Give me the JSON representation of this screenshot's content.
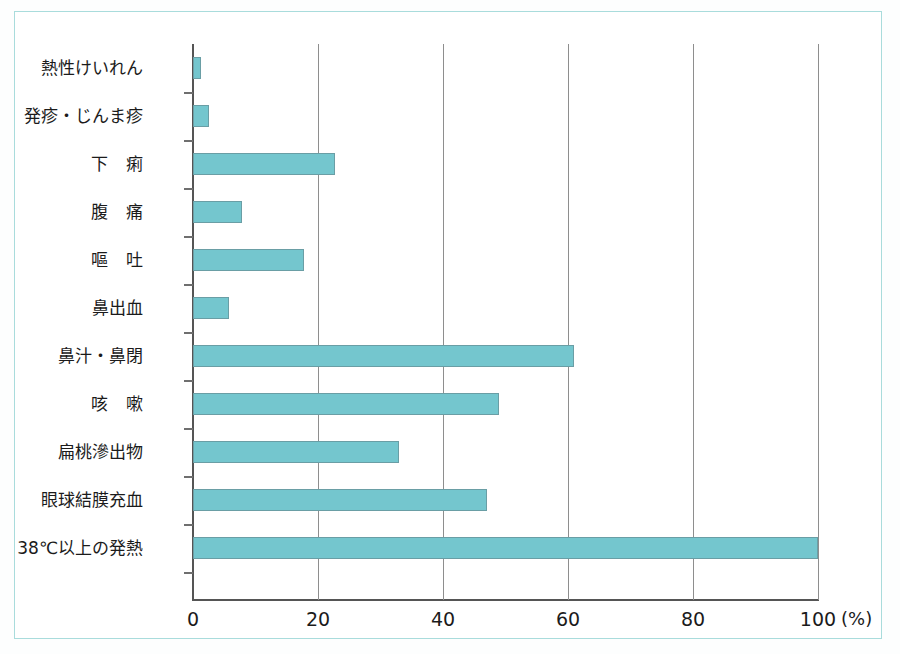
{
  "figure": {
    "accent_color": "#74c6ce",
    "frame_color": "#a9dcdc",
    "axis_color": "#555555",
    "grid_color": "#8e8e8e",
    "unit_label": "(%)"
  },
  "chart_data": {
    "type": "bar",
    "orientation": "horizontal",
    "title": "",
    "xlabel": "(%)",
    "ylabel": "",
    "xlim": [
      0,
      100
    ],
    "xticks": [
      0,
      20,
      40,
      60,
      80,
      100
    ],
    "xtick_labels": [
      "0",
      "20",
      "40",
      "60",
      "80",
      "100"
    ],
    "grid": true,
    "legend": false,
    "categories": [
      "熱性けいれん",
      "発疹・じんま疹",
      "下痢",
      "腹痛",
      "嘔吐",
      "鼻出血",
      "鼻汁・鼻閉",
      "咳嗽",
      "扁桃滲出物",
      "眼球結膜充血",
      "38℃以上の発熱"
    ],
    "values": [
      1.3,
      2.5,
      22.7,
      7.8,
      17.8,
      5.8,
      61.0,
      49.0,
      33.0,
      47.0,
      100.0
    ]
  },
  "category_style": [
    {
      "spaced": false
    },
    {
      "spaced": false
    },
    {
      "spaced": true
    },
    {
      "spaced": true
    },
    {
      "spaced": true
    },
    {
      "spaced": false
    },
    {
      "spaced": false
    },
    {
      "spaced": true
    },
    {
      "spaced": false
    },
    {
      "spaced": false
    },
    {
      "spaced": false
    }
  ]
}
